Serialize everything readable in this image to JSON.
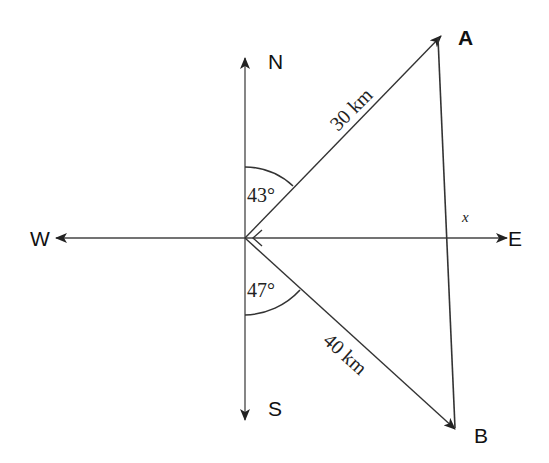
{
  "diagram": {
    "type": "bearing-triangle",
    "compass": {
      "north_label": "N",
      "south_label": "S",
      "east_label": "E",
      "west_label": "W"
    },
    "points": {
      "A_label": "A",
      "B_label": "B"
    },
    "edges": {
      "OA_label": "30 km",
      "OB_label": "40 km",
      "AB_label": "x"
    },
    "angles": {
      "north_angle": "43°",
      "south_angle": "47°"
    },
    "colors": {
      "line": "#333333",
      "text": "#111111",
      "background": "#ffffff"
    }
  }
}
